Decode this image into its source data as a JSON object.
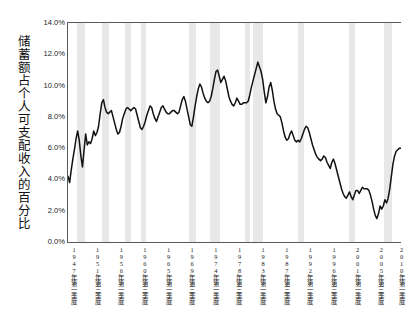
{
  "chart_data": {
    "type": "line",
    "title": "",
    "subtitle": "",
    "xlabel": "",
    "ylabel": "储蓄额占个人可支配收入的百分比",
    "ylim": [
      0,
      14
    ],
    "yticks": [
      0,
      2,
      4,
      6,
      8,
      10,
      12,
      14
    ],
    "ytick_labels": [
      "0.0%",
      "2.0%",
      "4.0%",
      "6.0%",
      "8.0%",
      "10.0%",
      "12.0%",
      "14.0%"
    ],
    "grid": false,
    "legend": "none",
    "x_start_label": "1947年第一季度",
    "x_end_label": "2010年第四季度",
    "xtick_labels": [
      "1947年第一季度",
      "1951年第三季度",
      "1956年第一季度",
      "1960年第三季度",
      "1965年第一季度",
      "1969年第三季度",
      "1974年第一季度",
      "1978年第三季度",
      "1983年第一季度",
      "1987年第三季度",
      "1992年第一季度",
      "1996年第三季度",
      "2001年第一季度",
      "2005年第三季度",
      "2010年第一季度"
    ],
    "xtick_positions_frac": [
      0.012,
      0.083,
      0.154,
      0.225,
      0.296,
      0.367,
      0.438,
      0.509,
      0.58,
      0.651,
      0.722,
      0.793,
      0.864,
      0.935,
      0.996
    ],
    "series": [
      {
        "name": "储蓄率",
        "color": "#111111",
        "x_unit": "quarter",
        "x_first": "1947Q1",
        "x_last": "2010Q4",
        "values": [
          4.2,
          3.8,
          4.6,
          5.3,
          5.9,
          6.6,
          7.1,
          6.5,
          5.5,
          4.8,
          5.9,
          6.9,
          6.2,
          6.4,
          6.3,
          6.6,
          7.1,
          6.8,
          7.0,
          7.4,
          8.2,
          8.9,
          9.1,
          8.6,
          8.3,
          8.2,
          8.3,
          8.4,
          8.0,
          7.6,
          7.2,
          6.9,
          7.0,
          7.4,
          7.9,
          8.2,
          8.5,
          8.6,
          8.5,
          8.4,
          8.5,
          8.6,
          8.5,
          8.1,
          7.7,
          7.3,
          7.2,
          7.4,
          7.7,
          8.1,
          8.4,
          8.7,
          8.6,
          8.2,
          7.9,
          7.7,
          8.0,
          8.3,
          8.6,
          8.7,
          8.5,
          8.3,
          8.2,
          8.2,
          8.3,
          8.4,
          8.4,
          8.3,
          8.2,
          8.3,
          8.7,
          9.1,
          9.3,
          9.0,
          8.5,
          8.0,
          7.5,
          7.4,
          8.0,
          8.7,
          9.3,
          9.8,
          10.1,
          9.9,
          9.5,
          9.2,
          9.0,
          8.9,
          9.0,
          9.3,
          9.8,
          10.4,
          10.9,
          11.0,
          10.6,
          10.2,
          10.4,
          10.6,
          10.3,
          9.8,
          9.3,
          9.0,
          8.8,
          8.7,
          8.9,
          9.2,
          9.0,
          8.8,
          8.8,
          8.9,
          8.9,
          8.9,
          9.0,
          9.4,
          9.9,
          10.3,
          10.7,
          11.1,
          11.5,
          11.2,
          10.9,
          10.4,
          9.6,
          8.9,
          9.3,
          9.9,
          10.2,
          9.7,
          9.0,
          8.5,
          8.2,
          8.1,
          8.0,
          7.6,
          7.1,
          6.7,
          6.5,
          6.6,
          6.9,
          7.1,
          6.8,
          6.5,
          6.4,
          6.5,
          6.4,
          6.6,
          6.9,
          7.2,
          7.4,
          7.3,
          7.0,
          6.6,
          6.2,
          5.9,
          5.6,
          5.4,
          5.3,
          5.2,
          5.3,
          5.5,
          5.4,
          5.1,
          4.9,
          4.7,
          5.1,
          5.3,
          5.0,
          4.6,
          4.2,
          3.8,
          3.4,
          3.1,
          2.9,
          2.8,
          3.0,
          3.2,
          2.9,
          2.7,
          3.0,
          3.3,
          3.3,
          3.1,
          3.3,
          3.5,
          3.4,
          3.4,
          3.4,
          3.3,
          3.0,
          2.6,
          2.1,
          1.7,
          1.5,
          1.8,
          2.3,
          2.1,
          2.3,
          2.7,
          2.5,
          2.8,
          3.4,
          4.2,
          5.0,
          5.5,
          5.8,
          5.9,
          6.0,
          6.0
        ]
      }
    ],
    "recession_bands": [
      {
        "label": "1948-1949",
        "start_frac": 0.028,
        "end_frac": 0.05
      },
      {
        "label": "1953-1954",
        "start_frac": 0.103,
        "end_frac": 0.124
      },
      {
        "label": "1957-1958",
        "start_frac": 0.17,
        "end_frac": 0.188
      },
      {
        "label": "1960-1961",
        "start_frac": 0.218,
        "end_frac": 0.234
      },
      {
        "label": "1969-1970",
        "start_frac": 0.364,
        "end_frac": 0.384
      },
      {
        "label": "1973-1975",
        "start_frac": 0.427,
        "end_frac": 0.457
      },
      {
        "label": "1980",
        "start_frac": 0.532,
        "end_frac": 0.546
      },
      {
        "label": "1981-1982",
        "start_frac": 0.557,
        "end_frac": 0.586
      },
      {
        "label": "1990-1991",
        "start_frac": 0.692,
        "end_frac": 0.709
      },
      {
        "label": "2001",
        "start_frac": 0.845,
        "end_frac": 0.862
      },
      {
        "label": "2007-2009",
        "start_frac": 0.948,
        "end_frac": 0.974
      }
    ]
  }
}
